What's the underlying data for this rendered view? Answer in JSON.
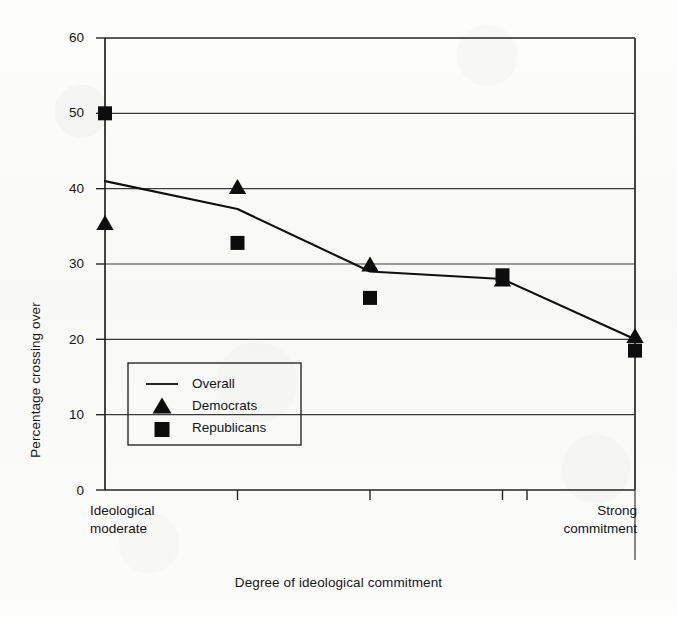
{
  "chart_data": {
    "type": "line",
    "title": "",
    "subtitle": "",
    "xlabel": "Degree of ideological commitment",
    "ylabel": "Percentage crossing over",
    "grid": true,
    "legend_position": "inner-lower-left",
    "ylim": [
      0,
      60
    ],
    "yticks": [
      0,
      10,
      20,
      30,
      40,
      50,
      60
    ],
    "ytick_labels": [
      "0",
      "10",
      "20",
      "30",
      "40",
      "50",
      "60"
    ],
    "x": [
      1,
      2,
      3,
      4,
      5
    ],
    "xtick_labels": [
      "",
      "",
      "",
      "",
      ""
    ],
    "x_axis_end_labels": {
      "left_line1": "Ideological",
      "left_line2": "moderate",
      "right_line1": "Strong",
      "right_line2": "commitment"
    },
    "series": [
      {
        "name": "Overall",
        "marker": "line",
        "values": [
          41.0,
          37.3,
          29.0,
          28.0,
          20.0
        ]
      },
      {
        "name": "Democrats",
        "marker": "triangle",
        "values": [
          35.5,
          40.3,
          30.0,
          28.0,
          20.5
        ]
      },
      {
        "name": "Republicans",
        "marker": "square",
        "values": [
          50.0,
          32.8,
          25.5,
          28.5,
          18.5
        ]
      }
    ],
    "colors": {
      "ink": "#101010",
      "grid": "#3a3a3a",
      "frame": "#262626",
      "background": "#fbfbfa"
    }
  },
  "legend": {
    "items": [
      {
        "label": "Overall",
        "glyph": "line-glyph"
      },
      {
        "label": "Democrats",
        "glyph": "triangle-glyph"
      },
      {
        "label": "Republicans",
        "glyph": "square-glyph"
      }
    ]
  }
}
